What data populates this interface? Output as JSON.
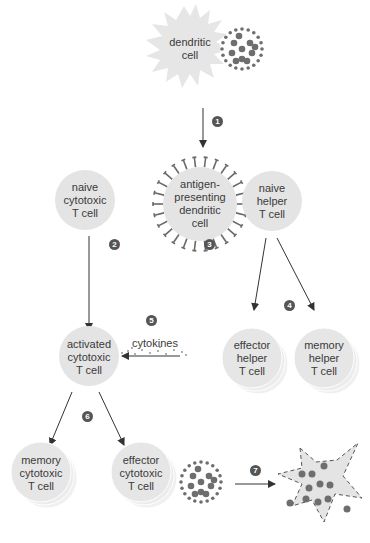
{
  "colors": {
    "cell_fill": "#e4e4e4",
    "stack_fill": "#eeeeee",
    "dot": "#6e6e6e",
    "step_badge": "#555555",
    "arrow": "#333333",
    "text": "#3a3a3a"
  },
  "cells": {
    "dendritic": "dendritic\ncell",
    "apc": "antigen-\npresenting\ndendritic\ncell",
    "naive_cytotoxic": "naive\ncytotoxic\nT cell",
    "naive_helper": "naive\nhelper\nT cell",
    "activated_cytotoxic": "activated\ncytotoxic\nT cell",
    "effector_helper": "effector\nhelper\nT cell",
    "memory_helper": "memory\nhelper\nT cell",
    "memory_cytotoxic": "memory\ncytotoxic\nT cell",
    "effector_cytotoxic": "effector\ncytotoxic\nT cell"
  },
  "labels": {
    "cytokines": "cytokines"
  },
  "steps": [
    "1",
    "2",
    "3",
    "4",
    "5",
    "6",
    "7"
  ]
}
